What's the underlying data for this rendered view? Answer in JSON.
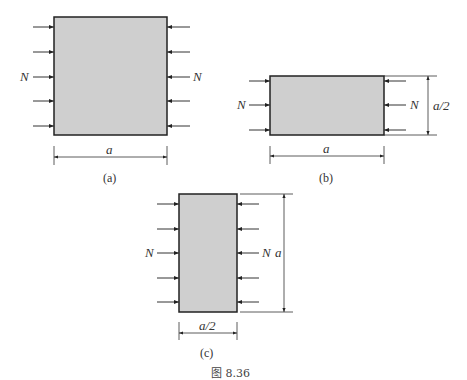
{
  "figure": {
    "caption": "图 8.36",
    "colors": {
      "fill": "#cfcfcf",
      "stroke": "#222222",
      "line": "#333333"
    },
    "panels": {
      "a": {
        "label": "(a)",
        "left_force": "N",
        "right_force": "N",
        "width_dim": "a"
      },
      "b": {
        "label": "(b)",
        "left_force": "N",
        "right_force": "N",
        "width_dim": "a",
        "height_dim": "a/2"
      },
      "c": {
        "label": "(c)",
        "left_force": "N",
        "right_force": "N",
        "width_dim": "a/2",
        "height_dim": "a"
      }
    }
  }
}
